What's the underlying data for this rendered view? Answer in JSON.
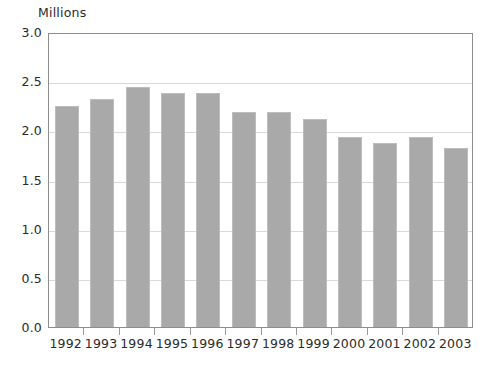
{
  "chart_data": {
    "type": "bar",
    "title": "",
    "subtitle": "",
    "unit_label": "Millions",
    "xlabel": "",
    "ylabel": "",
    "categories": [
      "1992",
      "1993",
      "1994",
      "1995",
      "1996",
      "1997",
      "1998",
      "1999",
      "2000",
      "2001",
      "2002",
      "2003"
    ],
    "values": [
      2.25,
      2.32,
      2.44,
      2.38,
      2.38,
      2.19,
      2.19,
      2.12,
      1.93,
      1.87,
      1.93,
      1.82
    ],
    "series": [
      {
        "name": "Millions",
        "values": [
          2.25,
          2.32,
          2.44,
          2.38,
          2.38,
          2.19,
          2.19,
          2.12,
          1.93,
          1.87,
          1.93,
          1.82
        ]
      }
    ],
    "ylim": [
      0.0,
      3.0
    ],
    "ytick_values": [
      0.0,
      0.5,
      1.0,
      1.5,
      2.0,
      2.5,
      3.0
    ],
    "ytick_labels": [
      "0.0",
      "0.5",
      "1.0",
      "1.5",
      "2.0",
      "2.5",
      "3.0"
    ],
    "grid": true,
    "grid_axis": "y",
    "legend": false,
    "legend_position": "none",
    "bar_color": "#a9a9a9",
    "bar_edge_color": "#bdbdbd",
    "grid_color": "#d9d9d9",
    "frame_color": "#8d8d8d",
    "text_color": "#2b2b2b",
    "background": "#ffffff"
  }
}
